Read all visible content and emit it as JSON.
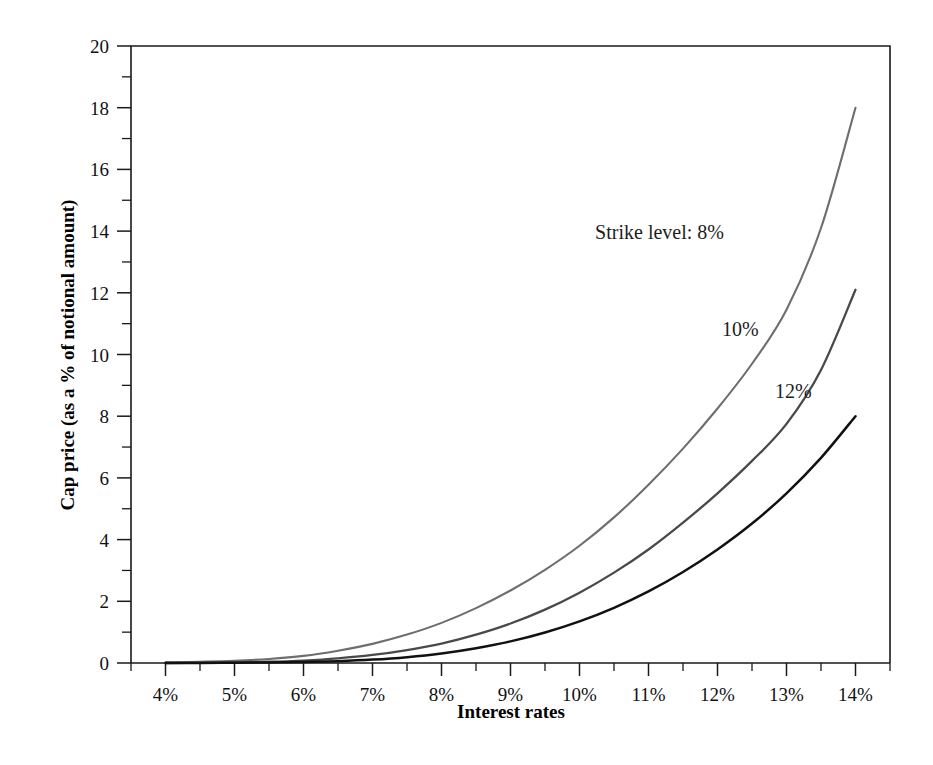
{
  "chart_data": {
    "type": "line",
    "title": "",
    "xlabel": "Interest rates",
    "ylabel": "Cap price (as a % of notional amount)",
    "xlim": [
      3.5,
      14.5
    ],
    "ylim": [
      0,
      20
    ],
    "grid": false,
    "legend_position": "inline-annotations",
    "x_tick_labels": [
      "4%",
      "5%",
      "6%",
      "7%",
      "8%",
      "9%",
      "10%",
      "11%",
      "12%",
      "13%",
      "14%"
    ],
    "x_tick_values": [
      4,
      5,
      6,
      7,
      8,
      9,
      10,
      11,
      12,
      13,
      14
    ],
    "x_minor_step": 0.5,
    "y_tick_labels": [
      "0",
      "2",
      "4",
      "6",
      "8",
      "10",
      "12",
      "14",
      "16",
      "18",
      "20"
    ],
    "y_tick_values": [
      0,
      2,
      4,
      6,
      8,
      10,
      12,
      14,
      16,
      18,
      20
    ],
    "y_minor_step": 1,
    "x": [
      4,
      4.5,
      5,
      5.5,
      6,
      6.5,
      7,
      7.5,
      8,
      8.5,
      9,
      9.5,
      10,
      10.5,
      11,
      11.5,
      12,
      12.5,
      13,
      13.5,
      14
    ],
    "series": [
      {
        "name": "Strike level: 8%",
        "color": "#6e6e6e",
        "line_width": 2.1,
        "values": [
          0.02,
          0.04,
          0.07,
          0.13,
          0.23,
          0.4,
          0.62,
          0.92,
          1.3,
          1.78,
          2.35,
          3.02,
          3.8,
          4.72,
          5.78,
          6.95,
          8.25,
          9.7,
          11.45,
          14.1,
          18.0
        ]
      },
      {
        "name": "10%",
        "color": "#494949",
        "line_width": 2.3,
        "values": [
          0.0,
          0.01,
          0.02,
          0.04,
          0.08,
          0.15,
          0.26,
          0.42,
          0.63,
          0.92,
          1.28,
          1.73,
          2.28,
          2.93,
          3.68,
          4.55,
          5.5,
          6.55,
          7.75,
          9.5,
          12.1
        ]
      },
      {
        "name": "12%",
        "color": "#111111",
        "line_width": 2.5,
        "values": [
          0.0,
          0.0,
          0.01,
          0.02,
          0.03,
          0.06,
          0.11,
          0.19,
          0.31,
          0.48,
          0.7,
          0.99,
          1.35,
          1.79,
          2.32,
          2.95,
          3.68,
          4.52,
          5.5,
          6.65,
          8.0
        ]
      }
    ],
    "annotations": [
      {
        "text": "Strike level: 8%",
        "x": 11.16,
        "y": 13.75,
        "anchor": "middle"
      },
      {
        "text": "10%",
        "x": 12.33,
        "y": 10.6,
        "anchor": "middle"
      },
      {
        "text": "12%",
        "x": 13.1,
        "y": 8.6,
        "anchor": "middle"
      }
    ]
  },
  "axes": {
    "x_title": "Interest rates",
    "y_title": "Cap price (as a % of notional amount)"
  }
}
